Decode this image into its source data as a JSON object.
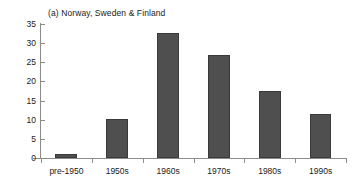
{
  "chart_data": {
    "type": "bar",
    "title": "(a) Norway, Sweden & Finland",
    "xlabel": "",
    "ylabel": "",
    "categories": [
      "pre-1950",
      "1950s",
      "1960s",
      "1970s",
      "1980s",
      "1990s"
    ],
    "values": [
      1,
      10.2,
      32.6,
      26.8,
      17.5,
      11.6
    ],
    "ylim": [
      0,
      35
    ],
    "yticks": [
      0,
      5,
      10,
      15,
      20,
      25,
      30,
      35
    ],
    "ytick_labels": [
      "0",
      "5",
      "10",
      "15",
      "20",
      "25",
      "30",
      "35"
    ],
    "grid": false,
    "legend": false,
    "bar_color": "#4f4f4f",
    "axis_color": "#8c8c8c",
    "text_color": "#1a1a1a"
  }
}
